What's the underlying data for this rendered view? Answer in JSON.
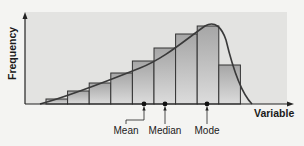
{
  "chart_data": {
    "type": "bar",
    "title": "",
    "xlabel": "Variable",
    "ylabel": "Frequency",
    "categories": [
      "1",
      "2",
      "3",
      "4",
      "5",
      "6",
      "7",
      "8",
      "9"
    ],
    "values": [
      5,
      13,
      21,
      31,
      43,
      56,
      70,
      78,
      39
    ],
    "overlay_curve": "left-skewed (negatively skewed) distribution curve",
    "markers": [
      {
        "name": "Mean",
        "position": 144
      },
      {
        "name": "Median",
        "position": 165
      },
      {
        "name": "Mode",
        "position": 207
      }
    ],
    "grid": false,
    "legend": "none"
  },
  "labels": {
    "y_axis": "Frequency",
    "x_axis": "Variable",
    "mean": "Mean",
    "median": "Median",
    "mode": "Mode"
  },
  "colors": {
    "plot_background": "#e3e3e1",
    "bar_top": "#a9a9a9",
    "bar_bottom": "#dadada",
    "outline": "#333333"
  }
}
